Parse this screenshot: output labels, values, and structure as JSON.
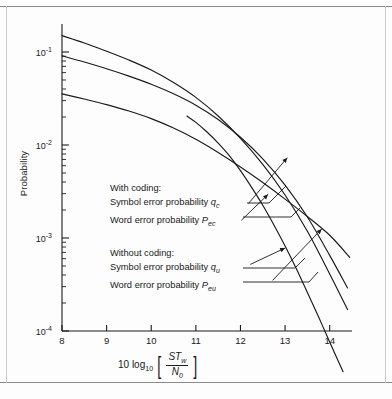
{
  "figure": {
    "background": "#fdfdfd",
    "line_color": "#1a1a1a",
    "frame_color": "#8a8a8a"
  },
  "axis": {
    "y_title": "Probability",
    "y_ticks": [
      {
        "label_base": "10",
        "label_exp": "-1",
        "value": 0.1
      },
      {
        "label_base": "10",
        "label_exp": "-2",
        "value": 0.01
      },
      {
        "label_base": "10",
        "label_exp": "-3",
        "value": 0.001
      },
      {
        "label_base": "10",
        "label_exp": "-4",
        "value": 0.0001
      }
    ],
    "x_ticks": [
      "8",
      "9",
      "10",
      "11",
      "12",
      "13",
      "14"
    ],
    "x_title_prefix": "10 log",
    "x_title_prefix_sub": "10",
    "x_title_numerator": "ST",
    "x_title_numerator_sub": "w",
    "x_title_denominator": "N",
    "x_title_denominator_sub": "0",
    "bracket_left": "[",
    "bracket_right": "]"
  },
  "legend": {
    "coded": {
      "heading": "With coding:",
      "symbol_line": "Symbol error probability ",
      "symbol_var": "q",
      "symbol_var_sub": "c",
      "word_line": "Word error probability ",
      "word_var": "P",
      "word_var_sub": "ec"
    },
    "uncoded": {
      "heading": "Without coding:",
      "symbol_line": "Symbol error probability ",
      "symbol_var": "q",
      "symbol_var_sub": "u",
      "word_line": "Word error probability ",
      "word_var": "P",
      "word_var_sub": "eu"
    }
  },
  "chart_data": {
    "type": "line",
    "title": "",
    "xlabel": "10 log10 [ST_w / N_0]",
    "ylabel": "Probability",
    "xlim": [
      8,
      14.5
    ],
    "ylim": [
      0.0001,
      0.2
    ],
    "yscale": "log",
    "grid": false,
    "legend_position": "inside-left",
    "series": [
      {
        "name": "Word error probability P_eu",
        "label_key": "uncoded.word",
        "x": [
          8,
          8.5,
          9,
          9.5,
          10,
          10.5,
          11,
          11.5,
          12,
          12.5,
          13,
          13.5,
          14,
          14.4
        ],
        "y": [
          0.15,
          0.125,
          0.102,
          0.082,
          0.064,
          0.047,
          0.0325,
          0.0205,
          0.0118,
          0.0062,
          0.0029,
          0.00118,
          0.00041,
          0.00017
        ]
      },
      {
        "name": "Symbol error probability q_u",
        "label_key": "uncoded.symbol",
        "x": [
          8,
          8.5,
          9,
          9.5,
          10,
          10.5,
          11,
          11.5,
          12,
          12.5,
          13,
          13.5,
          14,
          14.4
        ],
        "y": [
          0.091,
          0.078,
          0.066,
          0.055,
          0.045,
          0.0355,
          0.0268,
          0.0188,
          0.0121,
          0.0071,
          0.0037,
          0.00168,
          0.00065,
          0.00029
        ]
      },
      {
        "name": "Word error probability P_ec",
        "label_key": "coded.word",
        "x": [
          10.8,
          11,
          11.25,
          11.5,
          11.75,
          12,
          12.25,
          12.5,
          12.75,
          13,
          13.25,
          13.5,
          13.75,
          14,
          14.3
        ],
        "y": [
          0.0205,
          0.0175,
          0.0138,
          0.0105,
          0.0077,
          0.0053,
          0.0035,
          0.00225,
          0.00138,
          0.00082,
          0.00047,
          0.00026,
          0.000142,
          7.6e-05,
          3.65e-05
        ]
      },
      {
        "name": "Symbol error probability q_c",
        "label_key": "coded.symbol",
        "x": [
          8,
          8.5,
          9,
          9.5,
          10,
          10.5,
          11,
          11.5,
          12,
          12.5,
          13,
          13.5,
          14,
          14.45
        ],
        "y": [
          0.0355,
          0.0312,
          0.0272,
          0.0232,
          0.0192,
          0.0152,
          0.0115,
          0.0083,
          0.0058,
          0.00395,
          0.00262,
          0.0017,
          0.00107,
          0.00062
        ]
      }
    ],
    "annotations": [
      {
        "text": "q_c leader",
        "from": [
          12.18,
          0.00235
        ],
        "to": [
          13.05,
          0.0073
        ]
      },
      {
        "text": "P_ec leader",
        "from": [
          12.02,
          0.00155
        ],
        "to": [
          12.62,
          0.00295
        ]
      },
      {
        "text": "q_u leader",
        "from": [
          12.22,
          0.00052
        ],
        "to": [
          13.0,
          0.00078
        ]
      },
      {
        "text": "P_eu leader",
        "from": [
          12.72,
          0.00035
        ],
        "to": [
          13.82,
          0.00125
        ]
      }
    ]
  }
}
